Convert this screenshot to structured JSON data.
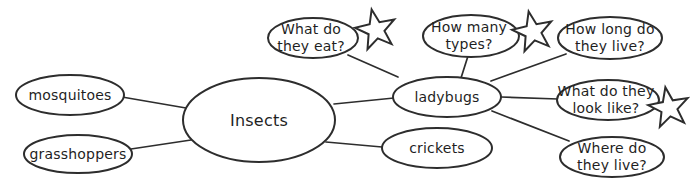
{
  "theme": {
    "background": "#ffffff",
    "node_fill": "#ffffff",
    "stroke": "#2d2d2d",
    "text_color": "#1f1f1f"
  },
  "diagram": {
    "type": "concept-map",
    "topic": {
      "id": "insects",
      "label": "Insects"
    },
    "nodes": [
      {
        "id": "mosquitoes",
        "lines": [
          "mosquitoes"
        ],
        "connects_to": "insects",
        "starred": false
      },
      {
        "id": "grasshoppers",
        "lines": [
          "grasshoppers"
        ],
        "connects_to": "insects",
        "starred": false
      },
      {
        "id": "ladybugs",
        "lines": [
          "ladybugs"
        ],
        "connects_to": "insects",
        "starred": false
      },
      {
        "id": "crickets",
        "lines": [
          "crickets"
        ],
        "connects_to": "insects",
        "starred": false
      },
      {
        "id": "what-do-they-eat",
        "lines": [
          "What do",
          "they eat?"
        ],
        "connects_to": "ladybugs",
        "starred": true
      },
      {
        "id": "how-many-types",
        "lines": [
          "How many",
          "types?"
        ],
        "connects_to": "ladybugs",
        "starred": true
      },
      {
        "id": "how-long-do-they-live",
        "lines": [
          "How long do",
          "they live?"
        ],
        "connects_to": "ladybugs",
        "starred": false
      },
      {
        "id": "what-do-they-look-like",
        "lines": [
          "What do they",
          "look like?"
        ],
        "connects_to": "ladybugs",
        "starred": true
      },
      {
        "id": "where-do-they-live",
        "lines": [
          "Where do",
          "they live?"
        ],
        "connects_to": "ladybugs",
        "starred": false
      }
    ]
  }
}
